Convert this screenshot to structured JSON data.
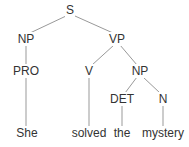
{
  "diagram": {
    "type": "syntax-tree",
    "sentence": "She solved the mystery",
    "colors": {
      "line": "#999999",
      "text": "#333333",
      "background": "#ffffff"
    },
    "nodes": [
      {
        "id": "S",
        "label": "S",
        "x": 70,
        "y": 10
      },
      {
        "id": "NP1",
        "label": "NP",
        "x": 26,
        "y": 39
      },
      {
        "id": "VP",
        "label": "VP",
        "x": 117,
        "y": 39
      },
      {
        "id": "PRO",
        "label": "PRO",
        "x": 26,
        "y": 71
      },
      {
        "id": "V",
        "label": "V",
        "x": 89,
        "y": 71
      },
      {
        "id": "NP2",
        "label": "NP",
        "x": 140,
        "y": 71
      },
      {
        "id": "DET",
        "label": "DET",
        "x": 122,
        "y": 99
      },
      {
        "id": "N",
        "label": "N",
        "x": 163,
        "y": 99
      },
      {
        "id": "w_she",
        "label": "She",
        "x": 27,
        "y": 133
      },
      {
        "id": "w_solved",
        "label": "solved",
        "x": 89,
        "y": 133
      },
      {
        "id": "w_the",
        "label": "the",
        "x": 122,
        "y": 133
      },
      {
        "id": "w_mystery",
        "label": "mystery",
        "x": 163,
        "y": 133
      }
    ],
    "edges": [
      {
        "from": "S",
        "to": "NP1",
        "x1": 66,
        "y1": 16,
        "x2": 30,
        "y2": 33
      },
      {
        "from": "S",
        "to": "VP",
        "x1": 75,
        "y1": 16,
        "x2": 113,
        "y2": 33
      },
      {
        "from": "NP1",
        "to": "PRO",
        "x1": 26,
        "y1": 45,
        "x2": 26,
        "y2": 65
      },
      {
        "from": "VP",
        "to": "V",
        "x1": 114,
        "y1": 45,
        "x2": 92,
        "y2": 65
      },
      {
        "from": "VP",
        "to": "NP2",
        "x1": 120,
        "y1": 45,
        "x2": 137,
        "y2": 65
      },
      {
        "from": "PRO",
        "to": "w_she",
        "x1": 26,
        "y1": 77,
        "x2": 26,
        "y2": 126
      },
      {
        "from": "V",
        "to": "w_solved",
        "x1": 89,
        "y1": 77,
        "x2": 89,
        "y2": 126
      },
      {
        "from": "NP2",
        "to": "DET",
        "x1": 137,
        "y1": 77,
        "x2": 125,
        "y2": 93
      },
      {
        "from": "NP2",
        "to": "N",
        "x1": 143,
        "y1": 77,
        "x2": 160,
        "y2": 93
      },
      {
        "from": "DET",
        "to": "w_the",
        "x1": 122,
        "y1": 105,
        "x2": 122,
        "y2": 126
      },
      {
        "from": "N",
        "to": "w_mystery",
        "x1": 163,
        "y1": 105,
        "x2": 163,
        "y2": 126
      }
    ]
  }
}
